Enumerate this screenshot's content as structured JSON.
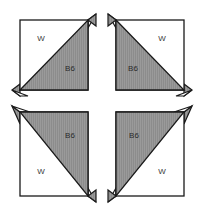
{
  "diagram": {
    "canvas": {
      "width": 204,
      "height": 215,
      "background": "#ffffff"
    },
    "colors": {
      "background": "#ffffff",
      "light_fabric": "#ffffff",
      "dark_fabric": "#8c8c8c",
      "outline": "#1a1a1a",
      "label_text": "#3a3a3a"
    },
    "fabric_legend": {
      "light_code": "W",
      "dark_code": "B6"
    },
    "units": [
      {
        "position": "top-left",
        "light_label": "W",
        "dark_label": "B6",
        "diagonal": "bottom-left-to-top-right",
        "dark_half": "lower-right"
      },
      {
        "position": "top-right",
        "light_label": "W",
        "dark_label": "B6",
        "diagonal": "top-left-to-bottom-right",
        "dark_half": "lower-left"
      },
      {
        "position": "bottom-left",
        "light_label": "W",
        "dark_label": "B6",
        "diagonal": "top-left-to-bottom-right",
        "dark_half": "upper-right"
      },
      {
        "position": "bottom-right",
        "light_label": "W",
        "dark_label": "B6",
        "diagonal": "bottom-left-to-top-right",
        "dark_half": "upper-left"
      }
    ]
  }
}
